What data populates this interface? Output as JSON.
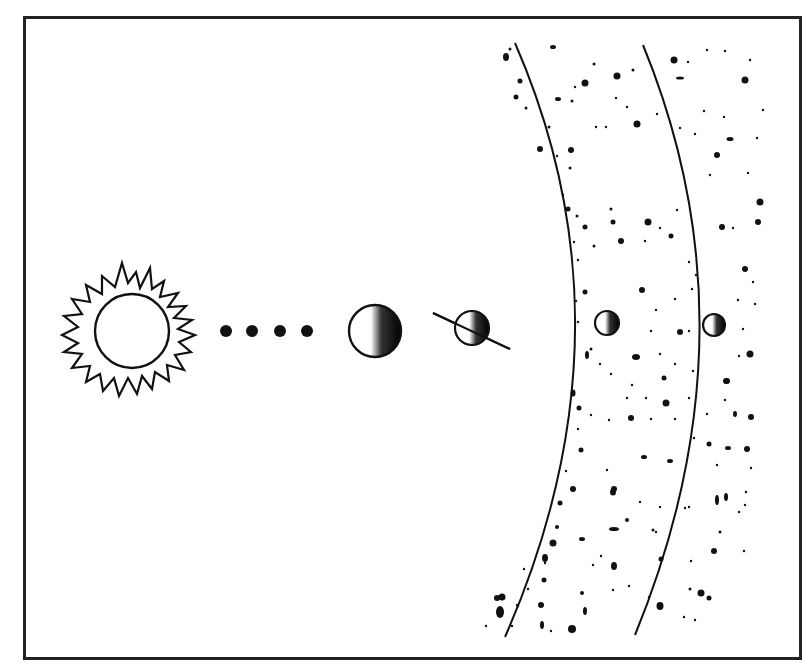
{
  "diagram": {
    "type": "solar-system-schematic",
    "elements": [
      {
        "id": "sun",
        "label": "sun",
        "cx": 132,
        "cy": 331,
        "r": 37
      },
      {
        "id": "dots",
        "label": "ellipsis-dots",
        "count": 4,
        "y": 331,
        "xs": [
          226,
          252,
          280,
          307
        ]
      },
      {
        "id": "planet-1",
        "label": "planet",
        "cx": 375,
        "cy": 331,
        "r": 26
      },
      {
        "id": "planet-2",
        "label": "tilted-planet",
        "cx": 472,
        "cy": 328,
        "r": 17
      },
      {
        "id": "orbit-1",
        "label": "orbit",
        "moon_cx": 607,
        "moon_cy": 323
      },
      {
        "id": "orbit-2",
        "label": "orbit",
        "moon_cx": 714,
        "moon_cy": 325
      },
      {
        "id": "belt",
        "label": "asteroid-belt"
      }
    ],
    "colors": {
      "ink": "#111111",
      "paper": "#ffffff"
    }
  }
}
